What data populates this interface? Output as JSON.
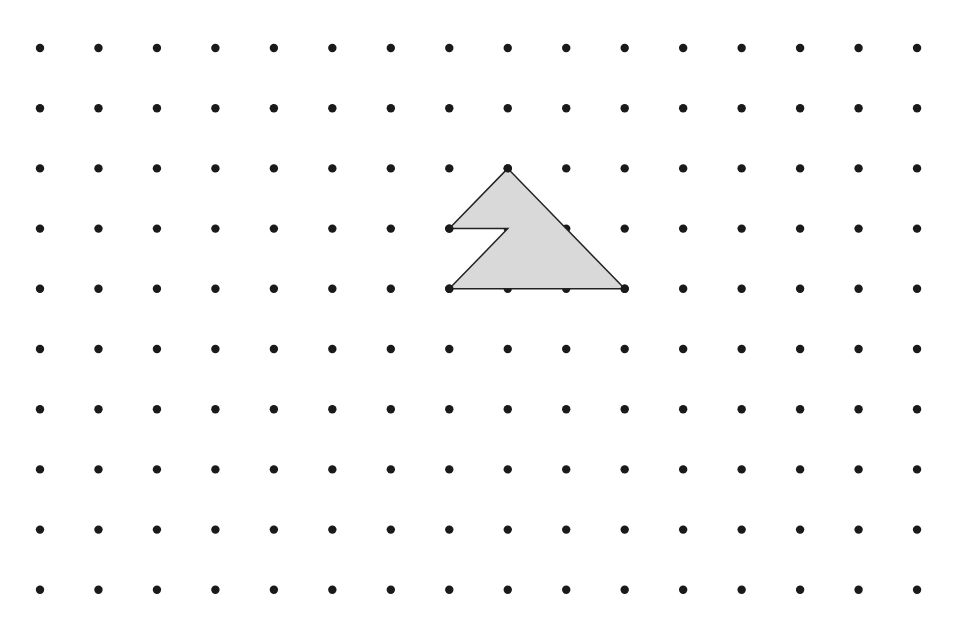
{
  "figure": {
    "type": "dot-grid-polygon",
    "grid": {
      "columns": 16,
      "rows": 10,
      "origin_px": [
        40,
        48
      ],
      "spacing_px": [
        58.47,
        60.2
      ],
      "dot_radius": 4.2,
      "dot_color": "#1a1a1a"
    },
    "polygon": {
      "description": "Shaded triangular shape with a notch cut from the left side",
      "vertices_grid": [
        [
          8,
          2
        ],
        [
          10,
          4
        ],
        [
          7,
          4
        ],
        [
          8,
          3
        ],
        [
          7,
          3
        ]
      ],
      "fill": "#d9d9d9",
      "stroke": "#222222",
      "stroke_width": 1.5
    },
    "background": "#ffffff"
  }
}
